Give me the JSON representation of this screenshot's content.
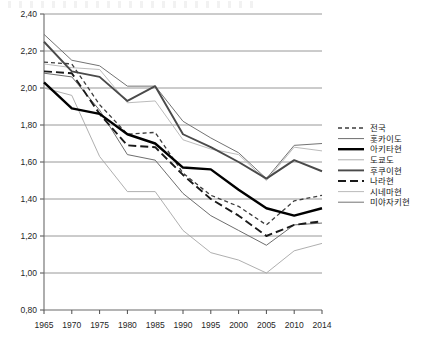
{
  "chart_data": {
    "type": "line",
    "title": "",
    "subtitle": "",
    "xlabel": "",
    "ylabel": "",
    "x": [
      1965,
      1970,
      1975,
      1980,
      1985,
      1990,
      1995,
      2000,
      2005,
      2010,
      2014
    ],
    "xtick_labels": [
      "1965",
      "1970",
      "1975",
      "1980",
      "1985",
      "1990",
      "1995",
      "2000",
      "2005",
      "2010",
      "2014"
    ],
    "ytick_labels": [
      "2,40",
      "2,20",
      "2,00",
      "1,80",
      "1,60",
      "1,40",
      "1,20",
      "1,00",
      "0,80"
    ],
    "ytick_values": [
      2.4,
      2.2,
      2.0,
      1.8,
      1.6,
      1.4,
      1.2,
      1.0,
      0.8
    ],
    "ylim": [
      0.8,
      2.4
    ],
    "ystep": 0.2,
    "grid": "horizontal",
    "legend_position": "right",
    "decimal_separator": ",",
    "series": [
      {
        "name": "전국",
        "style": "dotted",
        "color": "#3d3d3d",
        "width": 1.3,
        "dasharray": "4,3",
        "values": [
          2.14,
          2.13,
          1.91,
          1.75,
          1.76,
          1.54,
          1.42,
          1.36,
          1.26,
          1.39,
          1.42
        ]
      },
      {
        "name": "홋카이도",
        "style": "solid-thin",
        "color": "#5c5c5c",
        "width": 0.9,
        "dasharray": "",
        "values": [
          2.08,
          2.06,
          1.88,
          1.64,
          1.61,
          1.43,
          1.31,
          1.23,
          1.15,
          1.26,
          1.27
        ]
      },
      {
        "name": "아키타현",
        "style": "solid-thick",
        "color": "#000000",
        "width": 2.4,
        "dasharray": "",
        "values": [
          2.03,
          1.89,
          1.86,
          1.75,
          1.7,
          1.57,
          1.56,
          1.45,
          1.35,
          1.31,
          1.35
        ]
      },
      {
        "name": "도쿄도",
        "style": "solid-light",
        "color": "#a6a6a6",
        "width": 0.9,
        "dasharray": "",
        "values": [
          2.0,
          1.96,
          1.63,
          1.44,
          1.44,
          1.23,
          1.11,
          1.07,
          1.0,
          1.12,
          1.16
        ]
      },
      {
        "name": "후쿠이현",
        "style": "solid-medium",
        "color": "#4a4a4a",
        "width": 1.9,
        "dasharray": "",
        "values": [
          2.25,
          2.09,
          2.06,
          1.93,
          2.01,
          1.75,
          1.68,
          1.6,
          1.51,
          1.61,
          1.55
        ]
      },
      {
        "name": "나라현",
        "style": "dashed",
        "color": "#1a1a1a",
        "width": 1.9,
        "dasharray": "8,4",
        "values": [
          2.09,
          2.08,
          1.86,
          1.69,
          1.68,
          1.53,
          1.4,
          1.31,
          1.2,
          1.26,
          1.28
        ]
      },
      {
        "name": "시네마현",
        "style": "solid-light",
        "color": "#b3b3b3",
        "width": 0.9,
        "dasharray": "",
        "values": [
          2.13,
          2.11,
          2.1,
          1.92,
          1.93,
          1.72,
          1.67,
          1.64,
          1.5,
          1.68,
          1.66
        ]
      },
      {
        "name": "미야자키현",
        "style": "solid-thin",
        "color": "#737373",
        "width": 1.0,
        "dasharray": "",
        "values": [
          2.29,
          2.15,
          2.12,
          2.01,
          2.01,
          1.82,
          1.73,
          1.65,
          1.51,
          1.69,
          1.7
        ]
      }
    ]
  },
  "legend": {
    "entries": [
      {
        "label": "전국"
      },
      {
        "label": "홋카이도"
      },
      {
        "label": "아키타현"
      },
      {
        "label": "도쿄도"
      },
      {
        "label": "후쿠이현"
      },
      {
        "label": "나라현"
      },
      {
        "label": "시네마현"
      },
      {
        "label": "미야자키현"
      }
    ]
  }
}
